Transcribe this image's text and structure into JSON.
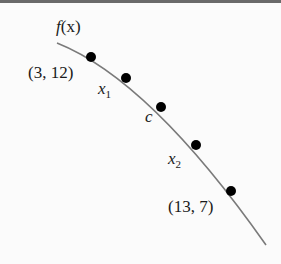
{
  "diagram": {
    "function_label": "f(x)",
    "curve_color": "#7a7a7a",
    "point_color": "#000000",
    "points": [
      {
        "label": "(3, 12)",
        "x": 91,
        "y": 57
      },
      {
        "label": "x1",
        "x": 126,
        "y": 78
      },
      {
        "label": "c",
        "x": 161,
        "y": 107
      },
      {
        "label": "x2",
        "x": 196,
        "y": 145
      },
      {
        "label": "(13, 7)",
        "x": 231,
        "y": 191
      }
    ],
    "labels": {
      "f": "f",
      "fx_arg": "(x)",
      "p1": "(3, 12)",
      "x1_base": "x",
      "x1_sub": "1",
      "c": "c",
      "x2_base": "x",
      "x2_sub": "2",
      "p5": "(13, 7)"
    }
  }
}
